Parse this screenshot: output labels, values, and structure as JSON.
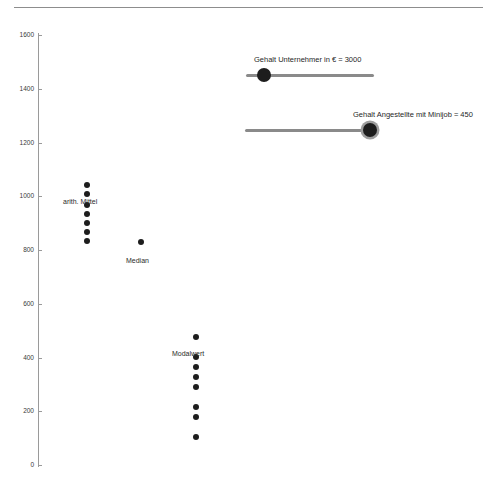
{
  "page": {
    "background": "#ffffff",
    "rule_color": "#8d8d8d",
    "axis_color": "#9a9a9a",
    "dot_color": "#1d1d1d",
    "slider_track_color": "#8a8a8a"
  },
  "chart_data": {
    "type": "scatter",
    "title": "",
    "subtitle": "",
    "xlabel": "",
    "ylabel": "",
    "grid": false,
    "legend_position": "inline-annotations",
    "ylim": [
      0,
      1650
    ],
    "xlim": [
      0,
      10
    ],
    "yticks": [
      0,
      200,
      400,
      600,
      800,
      1000,
      1200,
      1400,
      1600
    ],
    "ytick_labels": [
      "0",
      "200",
      "400",
      "600",
      "800",
      "1000",
      "1200",
      "1400",
      "1600"
    ],
    "xticks": [],
    "xtick_labels": [],
    "series": [
      {
        "name": "arith. Mittel",
        "x": 1,
        "values": [
          1041,
          1008,
          968,
          934,
          901,
          867,
          834
        ],
        "annotation": "arith. Mittel"
      },
      {
        "name": "Median",
        "x": 3.2,
        "values": [
          830
        ],
        "annotation": "Median"
      },
      {
        "name": "Modalwert",
        "x": 5.4,
        "values": [
          476,
          402,
          364,
          327,
          290,
          215,
          178,
          104
        ],
        "annotation": "Modalwert"
      }
    ],
    "annotations": [
      {
        "text": "arith. Mittel",
        "x": 1,
        "y": 960
      },
      {
        "text": "Median",
        "x": 3.2,
        "y": 755
      },
      {
        "text": "Modalwert",
        "x": 5.4,
        "y": 432
      }
    ]
  },
  "controls": {
    "sliders": [
      {
        "name": "gehalt-unternehmer",
        "label": "Gehalt Unternehmer in € = 3000",
        "value": "3000",
        "fill_percent": 9,
        "min_label": "",
        "max_label": ""
      },
      {
        "name": "gehalt-angestellte-minijob",
        "label": "Gehalt Angestellte mit Minijob = 450",
        "value": "450",
        "fill_percent": 95,
        "min_label": "",
        "max_label": ""
      }
    ]
  }
}
